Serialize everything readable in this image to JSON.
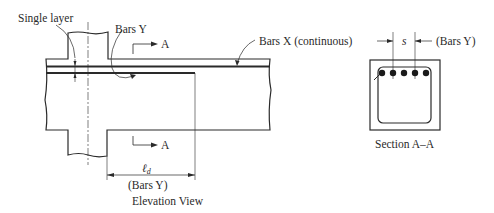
{
  "elevation_view": {
    "caption": "Elevation View",
    "labels": {
      "single_layer": "Single layer",
      "bars_y": "Bars Y",
      "bars_x": "Bars X (continuous)",
      "section_mark_top": "A",
      "section_mark_bottom": "A",
      "dimension_symbol": "ℓ",
      "dimension_subscript": "d",
      "dimension_note": "(Bars Y)"
    }
  },
  "section_view": {
    "caption": "Section A–A",
    "labels": {
      "spacing": "s",
      "bars_y": "(Bars Y)"
    },
    "bar_count": 5
  },
  "colors": {
    "line": "#2a2a2a",
    "background": "#ffffff"
  }
}
